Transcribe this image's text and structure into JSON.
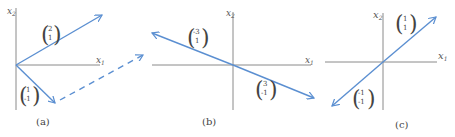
{
  "figure": {
    "panels": [
      {
        "id": "a",
        "caption": "(a)",
        "axes": {
          "x_label": "x",
          "x_sub": "1",
          "y_label": "x",
          "y_sub": "2"
        },
        "vectors": [
          {
            "top": "2",
            "bottom": "1",
            "style": "solid"
          },
          {
            "top": "1",
            "bottom": "-1",
            "style": "solid"
          },
          {
            "description": "translated copy of (2,1) starting at tip of (1,-1)",
            "style": "dashed"
          }
        ]
      },
      {
        "id": "b",
        "caption": "(b)",
        "axes": {
          "x_label": "x",
          "x_sub": "1",
          "y_label": "x",
          "y_sub": "2"
        },
        "vectors": [
          {
            "top": "-3",
            "bottom": "1",
            "style": "solid"
          },
          {
            "top": "3",
            "bottom": "-1",
            "style": "solid"
          }
        ]
      },
      {
        "id": "c",
        "caption": "(c)",
        "axes": {
          "x_label": "x",
          "x_sub": "1",
          "y_label": "x",
          "y_sub": "2"
        },
        "vectors": [
          {
            "top": "1",
            "bottom": "1",
            "style": "solid"
          },
          {
            "top": "-1",
            "bottom": "-1",
            "style": "solid"
          }
        ]
      }
    ],
    "colors": {
      "vector": "#5b8fd1",
      "axis": "#8a8a8a",
      "text": "#444444"
    }
  }
}
